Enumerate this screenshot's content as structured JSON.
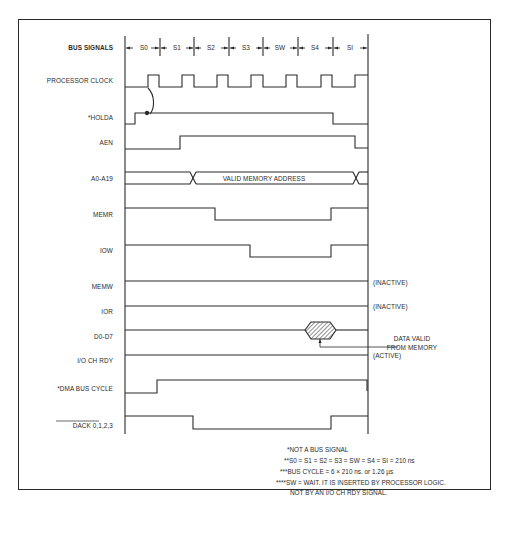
{
  "diagram": {
    "type": "timing-diagram",
    "header_label": "BUS SIGNALS",
    "bus_states": [
      "S0",
      "S1",
      "S2",
      "S3",
      "SW",
      "S4",
      "SI"
    ],
    "signals": [
      {
        "name": "PROCESSOR CLOCK",
        "kind": "clock"
      },
      {
        "name": "*HOLDA",
        "kind": "digital"
      },
      {
        "name": "AEN",
        "kind": "digital"
      },
      {
        "name": "A0-A19",
        "kind": "bus",
        "annotation": "VALID MEMORY ADDRESS"
      },
      {
        "name": "MEMR",
        "kind": "digital"
      },
      {
        "name": "IOW",
        "kind": "digital"
      },
      {
        "name": "MEMW",
        "kind": "digital",
        "status": "(INACTIVE)"
      },
      {
        "name": "IOR",
        "kind": "digital",
        "status": "(INACTIVE)"
      },
      {
        "name": "D0-D7",
        "kind": "bus",
        "annotation": "DATA VALID FROM MEMORY"
      },
      {
        "name": "I/O CH RDY",
        "kind": "digital",
        "status": "(ACTIVE)"
      },
      {
        "name": "*DMA BUS CYCLE",
        "kind": "digital"
      },
      {
        "name": "DACK 0,1,2,3",
        "kind": "digital",
        "overbar": true
      }
    ],
    "data_valid_label_1": "DATA VALID",
    "data_valid_label_2": "FROM MEMORY",
    "notes": [
      "*NOT A BUS SIGNAL",
      "**S0 = S1 = S2 = S3 = SW = S4 = SI = 210 ns",
      "***BUS CYCLE = 6 × 210 ns. or 1.26 µs",
      "****SW = WAIT. IT IS INSERTED BY PROCESSOR LOGIC.",
      "NOT BY AN I/O CH RDY SIGNAL."
    ]
  }
}
